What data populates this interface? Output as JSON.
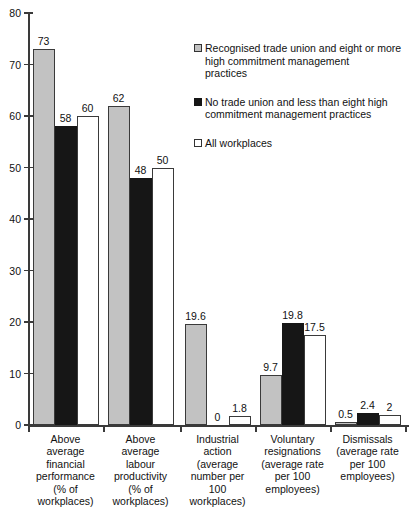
{
  "chart_data": {
    "type": "bar",
    "title": "",
    "xlabel": "",
    "ylabel": "",
    "ylim": [
      0,
      80
    ],
    "yticks": [
      0,
      10,
      20,
      30,
      40,
      50,
      60,
      70,
      80
    ],
    "grid": false,
    "legend_position": "top-right",
    "categories": [
      "Above average financial performance (% of workplaces)",
      "Above average labour productivity (% of workplaces)",
      "Industrial action (average number per 100 workplaces)",
      "Voluntary resignations (average rate per 100 employees)",
      "Dismissals (average rate per 100 employees)"
    ],
    "category_lines": [
      [
        "Above",
        "average",
        "financial",
        "performance",
        "(% of",
        "workplaces)"
      ],
      [
        "Above",
        "average",
        "labour",
        "productivity",
        "(% of",
        "workplaces)"
      ],
      [
        "Industrial",
        "action",
        "(average",
        "number per",
        "100",
        "workplaces)"
      ],
      [
        "Voluntary",
        "resignations",
        "(average rate",
        "per 100",
        "employees)"
      ],
      [
        "Dismissals",
        "(average rate",
        "per 100",
        "employees)"
      ]
    ],
    "series": [
      {
        "name": "Recognised trade union and eight or more high commitment management practices",
        "legend_lines": [
          "Recognised trade union and eight or more",
          "high commitment management",
          "practices"
        ],
        "color": "#c2c2c2",
        "values": [
          73,
          62,
          19.6,
          9.7,
          0.5
        ],
        "labels": [
          "73",
          "62",
          "19.6",
          "9.7",
          "0.5"
        ]
      },
      {
        "name": "No trade union and less than eight high commitment management practices",
        "legend_lines": [
          "No trade union and less than eight high",
          "commitment management practices"
        ],
        "color": "#161616",
        "values": [
          58,
          48,
          0,
          19.8,
          2.4
        ],
        "labels": [
          "58",
          "48",
          "0",
          "19.8",
          "2.4"
        ]
      },
      {
        "name": "All workplaces",
        "legend_lines": [
          "All workplaces"
        ],
        "color": "#ffffff",
        "values": [
          60,
          50,
          1.8,
          17.5,
          2
        ],
        "labels": [
          "60",
          "50",
          "1.8",
          "17.5",
          "2"
        ]
      }
    ]
  }
}
